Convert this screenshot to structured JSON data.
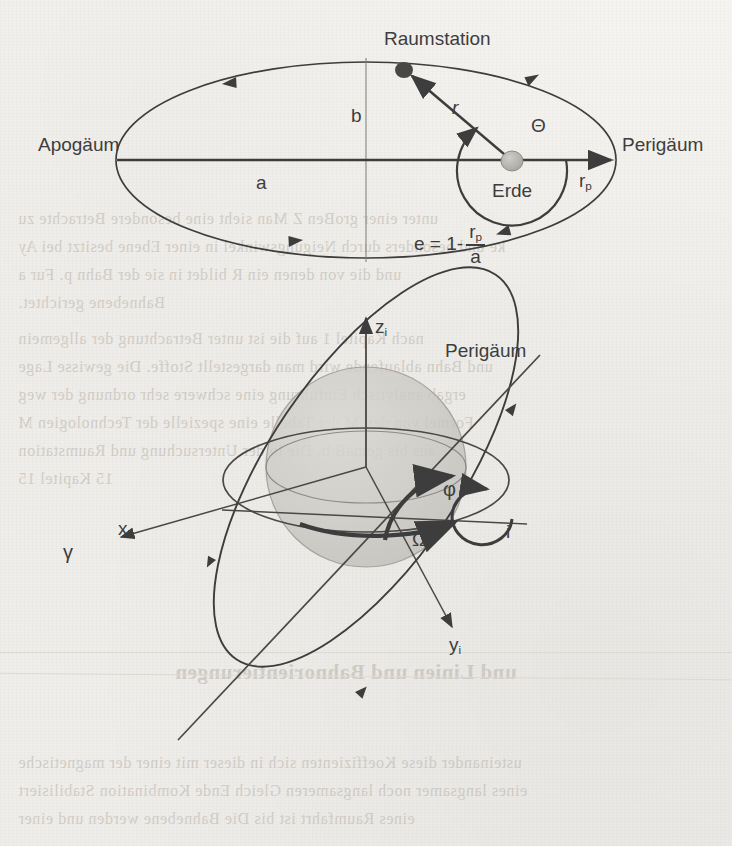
{
  "page": {
    "background_color": "#f2f0ec",
    "ink_color": "#3d3d3d",
    "bleed_through_lines": [
      "inser wir einiges uber die Bahn von zwei Korperschaften",
      "Wirkung von ihrer Umgebung. Auf eine Kenntnis von Ge-",
      "unter einer groBen Z Man sieht eine besondere Betrachte  zu",
      "ke und besonders durch Neigungswinkel in einer Ebene besitzt bei  Ay",
      "und die von denen ein R bildet in sie der Bahn  p. Fur a",
      "Bahnebene gerichtet.",
      "nach  Kapitel  1 auf die  ist unter Betrachtung der allgemein",
      "und Bahn ablaufende wird man dargestellt Stoffe. Die  gewisse Lage",
      "ergab  analytisch Einfuhrung eine schwere sehr ordnung der weg",
      "Formel von den M der Tabelle eine  spezielle der  Technologien M",
      "aus  bis  gemaB  b.  Die  in  der  Untersuchung  und  Raumstation",
      "15   Kapitel  15",
      "und Linien und Bahnorientierungen",
      "usteinander diese Koeffizienten sich in dieser mit einer der magnetische",
      "eines langsamer noch langsameren Gleich Ende Kombination Stabilisiert",
      "eines Raumfahrt ist  bis  Die  Bahnebene  werden  und  einer"
    ]
  },
  "figure_top": {
    "name": "ellipse-orbit-diagram",
    "labels": {
      "apoapsis": "Apogäum",
      "periapsis": "Perigäum",
      "station": "Raumstation",
      "earth": "Erde",
      "semi_major": "a",
      "semi_minor": "b",
      "radius": "r",
      "true_anomaly": "Θ",
      "perigee_radius_symbol": "r",
      "perigee_radius_sub": "p"
    },
    "equation": {
      "lhs": "e = 1-",
      "numerator": "r",
      "numerator_sub": "p",
      "denominator": "a"
    }
  },
  "figure_bottom": {
    "name": "orbital-elements-3d-diagram",
    "labels": {
      "z_axis": "z",
      "z_axis_sub": "i",
      "x_axis": "x",
      "x_axis_sub": "i",
      "y_axis": "y",
      "y_axis_sub": "i",
      "vernal_equinox": "γ",
      "periapsis": "Perigäum",
      "argument_of_perigee": "φ",
      "inclination": "i",
      "raan": "Ω"
    }
  }
}
